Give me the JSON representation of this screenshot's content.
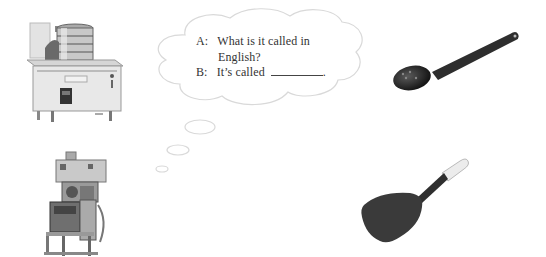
{
  "speech_bubble": {
    "line_a_label": "A:",
    "line_a_text": "What is it called in",
    "line_a_text_cont": "English?",
    "line_b_label": "B:",
    "line_b_text": "It’s called",
    "line_b_end": "."
  },
  "images": [
    {
      "name": "steamer-stove",
      "icon": "steamer-stove-icon"
    },
    {
      "name": "ladle",
      "icon": "ladle-icon"
    },
    {
      "name": "mixing-machine",
      "icon": "mixer-machine-icon"
    },
    {
      "name": "spatula",
      "icon": "spatula-icon"
    }
  ],
  "colors": {
    "cloud_stroke": "#d8d8d8",
    "text": "#333333",
    "utensil_dark": "#2a2a2a"
  }
}
